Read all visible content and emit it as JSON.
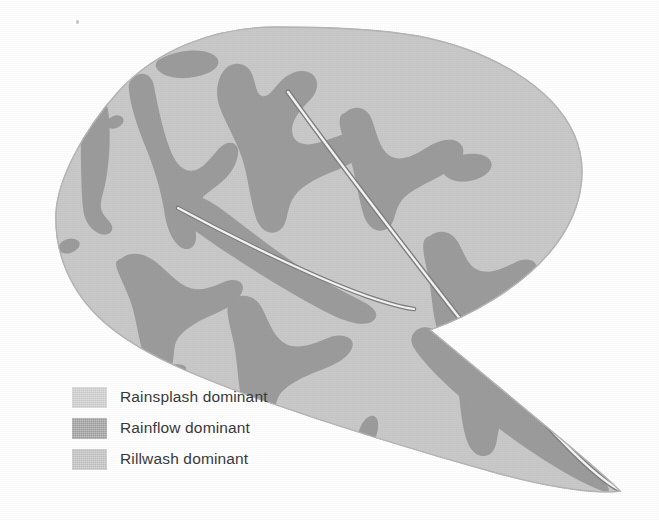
{
  "figure": {
    "alt": "Leaf outline subdivided into rainsplash, rainflow and rillwash dominant zones with two midrib veins"
  },
  "colors": {
    "background": "#ffffff",
    "rainsplash": "#c9c9c9",
    "rainflow": "#9c9c9c",
    "rillwash": "#bdbdbd",
    "leaf_edge": "#b4b4b4",
    "vein_line": "#f2f2f2",
    "vein_outline": "#8a8a8a",
    "label_text": "#39393b"
  },
  "legend": {
    "name": "erosion-process-legend",
    "items": [
      {
        "label": "Rainsplash dominant",
        "color": "#c9c9c9",
        "swatch_name": "rainsplash"
      },
      {
        "label": "Rainflow dominant",
        "color": "#9c9c9c",
        "swatch_name": "rainflow"
      },
      {
        "label": "Rillwash dominant",
        "color": "#bdbdbd",
        "swatch_name": "rillwash"
      }
    ]
  },
  "diagram": {
    "leaf_outline": "M 276 27 C 200 28 132 68 96 126 C 62 180 52 240 80 294 C 104 340 160 372 228 390 C 300 410 400 440 500 470 C 556 486 596 492 620 491 C 600 470 558 436 504 392 C 452 348 500 372 548 318 C 586 276 590 214 556 152 C 512 72 392 26 276 27 Z",
    "veins": [
      {
        "name": "midrib-primary",
        "from": [
          288,
          92
        ],
        "to": [
          618,
          489
        ]
      },
      {
        "name": "midrib-secondary",
        "from": [
          178,
          208
        ],
        "to": [
          412,
          306
        ]
      }
    ],
    "zones": [
      {
        "name": "rainflow-patch-upper-left-blob",
        "zone": "rainflow"
      },
      {
        "name": "rainflow-patch-left-finger",
        "zone": "rainflow"
      },
      {
        "name": "rainflow-patch-left-lobe",
        "zone": "rainflow"
      },
      {
        "name": "rainflow-patch-upper-centre-lobe",
        "zone": "rainflow"
      },
      {
        "name": "rainflow-patch-right-lobe",
        "zone": "rainflow"
      },
      {
        "name": "rainflow-patch-right-small-blob",
        "zone": "rainflow"
      },
      {
        "name": "rainflow-patch-centre-band",
        "zone": "rainflow"
      },
      {
        "name": "rainflow-patch-lower-left-lobe",
        "zone": "rainflow"
      },
      {
        "name": "rainflow-patch-lower-centre-lobe",
        "zone": "rainflow"
      },
      {
        "name": "rainflow-patch-lower-right-star",
        "zone": "rainflow"
      },
      {
        "name": "rainflow-patch-tip-band",
        "zone": "rainflow"
      },
      {
        "name": "rainflow-speck-left",
        "zone": "rainflow"
      },
      {
        "name": "rainflow-speck-lower-left",
        "zone": "rainflow"
      },
      {
        "name": "rainflow-speck-lower-centre",
        "zone": "rainflow"
      },
      {
        "name": "rainflow-speck-lower-mid",
        "zone": "rainflow"
      },
      {
        "name": "rainsplash-matrix",
        "zone": "rainsplash"
      }
    ]
  }
}
